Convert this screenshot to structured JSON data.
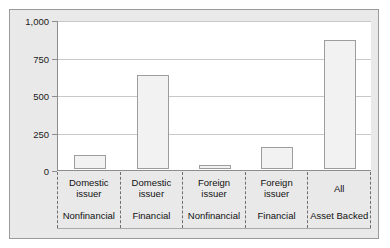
{
  "chart_data": {
    "type": "bar",
    "title": "",
    "xlabel": "",
    "ylabel": "",
    "ylim": [
      0,
      1000
    ],
    "yticks": [
      0,
      250,
      500,
      750,
      1000
    ],
    "ytick_labels": [
      "0",
      "250",
      "500",
      "750",
      "1,000"
    ],
    "grid": true,
    "legend": "none",
    "categories": [
      "Domestic issuer / Nonfinancial",
      "Domestic issuer / Financial",
      "Foreign issuer / Nonfinancial",
      "Foreign issuer / Financial",
      "All Asset Backed"
    ],
    "category_labels": [
      {
        "issuer_line1": "Domestic",
        "issuer_line2": "issuer",
        "sector": "Nonfinancial"
      },
      {
        "issuer_line1": "Domestic",
        "issuer_line2": "issuer",
        "sector": "Financial"
      },
      {
        "issuer_line1": "Foreign",
        "issuer_line2": "issuer",
        "sector": "Nonfinancial"
      },
      {
        "issuer_line1": "Foreign",
        "issuer_line2": "issuer",
        "sector": "Financial"
      },
      {
        "issuer_line1": "All",
        "issuer_line2": "",
        "sector": "Asset Backed"
      }
    ],
    "values": [
      95,
      630,
      25,
      150,
      860
    ],
    "colors": {
      "bar_fill": "#f2f2f2",
      "bar_border": "#9d9d9d",
      "panel_background": "#e9e9e9",
      "plot_background": "#ffffff",
      "gridline": "#c8c8c8",
      "axis": "#8d8d8d",
      "separator": "#6f6f6f",
      "text": "#111111"
    }
  }
}
